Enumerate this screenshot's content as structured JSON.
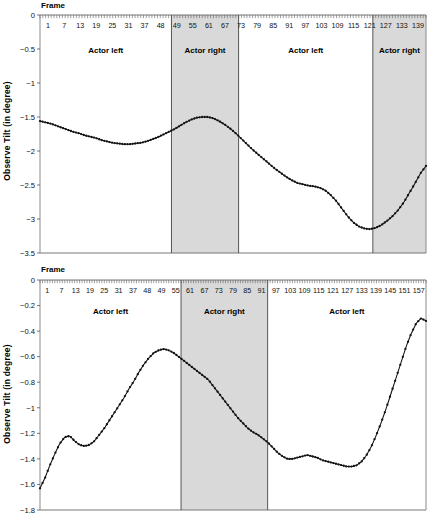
{
  "figure": {
    "background": "#ffffff",
    "series_color": "#111111",
    "band_color": "#d9d9d9",
    "axis_color": "#8a8a8a"
  },
  "charts": [
    {
      "id": "top",
      "frame_title": "Frame",
      "ylabel": "Observe Tilt (in degree)",
      "chart_data": {
        "type": "line",
        "title": "",
        "xlabel": "Frame",
        "ylabel": "Observe Tilt (in degree)",
        "xlim": [
          1,
          139
        ],
        "ylim": [
          -3.5,
          0
        ],
        "grid": false,
        "legend": "none",
        "xticks": [
          1,
          7,
          13,
          19,
          25,
          31,
          37,
          48,
          49,
          55,
          61,
          67,
          73,
          79,
          85,
          91,
          97,
          103,
          109,
          115,
          121,
          127,
          133,
          139
        ],
        "yticks": [
          0,
          -0.5,
          -1,
          -1.5,
          -2,
          -2.5,
          -3,
          -3.5
        ],
        "ytick_labels": [
          "0",
          "-0.5",
          "-1",
          "-1.5",
          "-2",
          "-2.5",
          "-3",
          "-3.5"
        ],
        "regions": [
          {
            "label": "Actor left",
            "x0": 1,
            "x1": 48,
            "shaded": false
          },
          {
            "label": "Actor right",
            "x0": 48,
            "x1": 72,
            "shaded": true
          },
          {
            "label": "Actor left",
            "x0": 72,
            "x1": 120,
            "shaded": false
          },
          {
            "label": "Actor right",
            "x0": 120,
            "x1": 139,
            "shaded": true
          }
        ],
        "x": [
          1,
          3,
          5,
          7,
          9,
          11,
          13,
          15,
          17,
          19,
          21,
          23,
          25,
          27,
          29,
          31,
          33,
          35,
          37,
          39,
          41,
          43,
          45,
          47,
          49,
          51,
          53,
          55,
          57,
          59,
          61,
          63,
          65,
          67,
          69,
          71,
          73,
          75,
          77,
          79,
          81,
          83,
          85,
          87,
          89,
          91,
          93,
          95,
          97,
          99,
          101,
          103,
          105,
          107,
          109,
          111,
          113,
          115,
          117,
          119,
          121,
          123,
          125,
          127,
          129,
          131,
          133,
          135,
          137,
          139
        ],
        "y": [
          -1.56,
          -1.58,
          -1.6,
          -1.63,
          -1.66,
          -1.69,
          -1.72,
          -1.74,
          -1.77,
          -1.79,
          -1.81,
          -1.84,
          -1.86,
          -1.88,
          -1.89,
          -1.9,
          -1.9,
          -1.89,
          -1.88,
          -1.86,
          -1.83,
          -1.8,
          -1.76,
          -1.72,
          -1.68,
          -1.63,
          -1.58,
          -1.54,
          -1.51,
          -1.5,
          -1.5,
          -1.52,
          -1.56,
          -1.61,
          -1.67,
          -1.74,
          -1.82,
          -1.9,
          -1.98,
          -2.05,
          -2.12,
          -2.19,
          -2.26,
          -2.32,
          -2.38,
          -2.43,
          -2.47,
          -2.49,
          -2.51,
          -2.52,
          -2.54,
          -2.58,
          -2.65,
          -2.74,
          -2.85,
          -2.96,
          -3.05,
          -3.11,
          -3.14,
          -3.15,
          -3.13,
          -3.09,
          -3.03,
          -2.96,
          -2.87,
          -2.76,
          -2.62,
          -2.48,
          -2.33,
          -2.22
        ]
      }
    },
    {
      "id": "bottom",
      "frame_title": "Frame",
      "ylabel": "Observe Tilt (in degree)",
      "chart_data": {
        "type": "line",
        "title": "",
        "xlabel": "Frame",
        "ylabel": "Observe Tilt (in degree)",
        "xlim": [
          1,
          157
        ],
        "ylim": [
          -1.8,
          0
        ],
        "grid": false,
        "legend": "none",
        "xticks": [
          1,
          7,
          13,
          19,
          25,
          31,
          37,
          48,
          49,
          55,
          61,
          67,
          73,
          79,
          85,
          91,
          97,
          103,
          109,
          115,
          121,
          127,
          133,
          139,
          145,
          151,
          157
        ],
        "yticks": [
          0,
          -0.2,
          -0.4,
          -0.6,
          -0.8,
          -1,
          -1.2,
          -1.4,
          -1.6,
          -1.8
        ],
        "ytick_labels": [
          "0",
          "-0.2",
          "-0.4",
          "-0.6",
          "-0.8",
          "-1",
          "-1.2",
          "-1.4",
          "-1.6",
          "-1.8"
        ],
        "regions": [
          {
            "label": "Actor left",
            "x0": 1,
            "x1": 58,
            "shaded": false
          },
          {
            "label": "Actor right",
            "x0": 58,
            "x1": 93,
            "shaded": true
          },
          {
            "label": "Actor left",
            "x0": 93,
            "x1": 157,
            "shaded": false
          }
        ],
        "x": [
          1,
          3,
          5,
          7,
          9,
          11,
          13,
          15,
          17,
          19,
          21,
          23,
          25,
          27,
          29,
          31,
          33,
          35,
          37,
          39,
          41,
          43,
          45,
          47,
          49,
          51,
          53,
          55,
          57,
          59,
          61,
          63,
          65,
          67,
          69,
          71,
          73,
          75,
          77,
          79,
          81,
          83,
          85,
          87,
          89,
          91,
          93,
          95,
          97,
          99,
          101,
          103,
          105,
          107,
          109,
          111,
          113,
          115,
          117,
          119,
          121,
          123,
          125,
          127,
          129,
          131,
          133,
          135,
          137,
          139,
          141,
          143,
          145,
          147,
          149,
          151,
          153,
          155,
          157
        ],
        "y": [
          -1.63,
          -1.55,
          -1.45,
          -1.36,
          -1.28,
          -1.23,
          -1.22,
          -1.26,
          -1.29,
          -1.3,
          -1.29,
          -1.26,
          -1.21,
          -1.16,
          -1.1,
          -1.04,
          -0.98,
          -0.92,
          -0.85,
          -0.79,
          -0.72,
          -0.66,
          -0.61,
          -0.57,
          -0.55,
          -0.54,
          -0.55,
          -0.57,
          -0.6,
          -0.63,
          -0.66,
          -0.69,
          -0.72,
          -0.75,
          -0.78,
          -0.83,
          -0.88,
          -0.93,
          -0.98,
          -1.03,
          -1.08,
          -1.12,
          -1.16,
          -1.19,
          -1.21,
          -1.24,
          -1.27,
          -1.31,
          -1.35,
          -1.38,
          -1.4,
          -1.4,
          -1.39,
          -1.38,
          -1.37,
          -1.38,
          -1.39,
          -1.41,
          -1.42,
          -1.43,
          -1.44,
          -1.45,
          -1.46,
          -1.46,
          -1.45,
          -1.42,
          -1.37,
          -1.3,
          -1.21,
          -1.11,
          -1.0,
          -0.88,
          -0.76,
          -0.64,
          -0.52,
          -0.42,
          -0.34,
          -0.3,
          -0.32
        ]
      }
    }
  ]
}
